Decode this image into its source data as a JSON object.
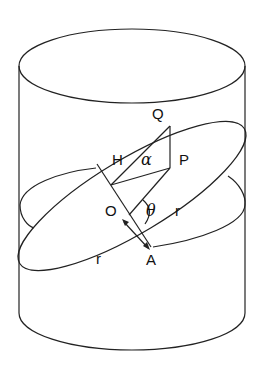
{
  "figure": {
    "labels": {
      "Q": "Q",
      "H": "H",
      "alpha": "α",
      "P": "P",
      "O": "O",
      "theta": "θ",
      "r_right": "r",
      "r_left": "r",
      "A": "A"
    },
    "colors": {
      "stroke": "#222222",
      "background": "#ffffff"
    }
  }
}
